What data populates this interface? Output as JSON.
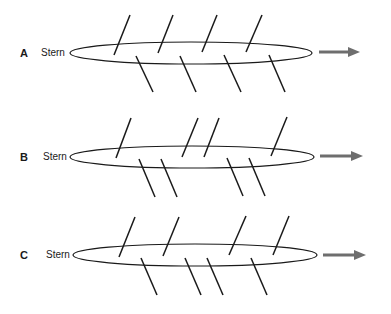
{
  "panels": [
    {
      "id": "A",
      "stern_label": "Stern",
      "hull": {
        "cx": 191,
        "cy": 53,
        "rx": 121,
        "ry": 11
      },
      "oars_top": [
        [
          114,
          55,
          130,
          15
        ],
        [
          158,
          53,
          173,
          15
        ],
        [
          202,
          52,
          217,
          15
        ],
        [
          246,
          52,
          262,
          15
        ]
      ],
      "oars_bottom": [
        [
          136,
          56,
          153,
          92
        ],
        [
          180,
          56,
          196,
          92
        ],
        [
          224,
          55,
          241,
          92
        ],
        [
          269,
          55,
          285,
          92
        ]
      ],
      "arrow": {
        "x1": 319,
        "x2": 360,
        "y": 52
      }
    },
    {
      "id": "B",
      "stern_label": "Stern",
      "hull": {
        "cx": 192,
        "cy": 157,
        "rx": 122,
        "ry": 11
      },
      "oars_top": [
        [
          116,
          158,
          131,
          118
        ],
        [
          182,
          157,
          198,
          118
        ],
        [
          204,
          157,
          219,
          118
        ],
        [
          271,
          156,
          287,
          117
        ]
      ],
      "oars_bottom": [
        [
          139,
          159,
          155,
          197
        ],
        [
          161,
          159,
          177,
          197
        ],
        [
          227,
          158,
          243,
          196
        ],
        [
          249,
          158,
          265,
          196
        ]
      ],
      "arrow": {
        "x1": 320,
        "x2": 363,
        "y": 156
      }
    },
    {
      "id": "C",
      "stern_label": "Stern",
      "hull": {
        "cx": 195,
        "cy": 255,
        "rx": 122,
        "ry": 11
      },
      "oars_top": [
        [
          119,
          257,
          135,
          217
        ],
        [
          163,
          256,
          179,
          217
        ],
        [
          229,
          255,
          246,
          216
        ],
        [
          273,
          255,
          289,
          216
        ]
      ],
      "oars_bottom": [
        [
          141,
          258,
          157,
          295
        ],
        [
          185,
          258,
          201,
          295
        ],
        [
          207,
          258,
          223,
          295
        ],
        [
          251,
          258,
          267,
          295
        ]
      ],
      "arrow": {
        "x1": 323,
        "x2": 366,
        "y": 255
      }
    }
  ],
  "colors": {
    "line": "#1a1a1a",
    "arrow": "#6e6e6e"
  }
}
